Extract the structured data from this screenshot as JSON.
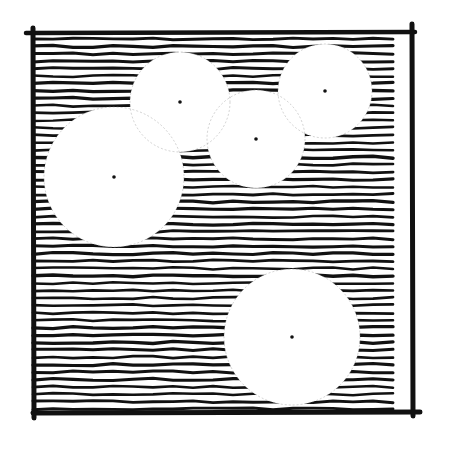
{
  "illustration": {
    "description": "Hand-drawn square with horizontal hatching and five white circles, each marked with a center dot",
    "colors": {
      "ink": "#111111",
      "paper": "#ffffff",
      "overlap_line": "#9a9a9a"
    },
    "frame": {
      "x": 33,
      "y": 33,
      "width": 379,
      "height": 380
    },
    "hatch_spacing": 7.4,
    "circles": [
      {
        "id": "circle-top-middle",
        "cx": 180,
        "cy": 102,
        "r": 50
      },
      {
        "id": "circle-top-right",
        "cx": 325,
        "cy": 91,
        "r": 47
      },
      {
        "id": "circle-center",
        "cx": 256,
        "cy": 139,
        "r": 49
      },
      {
        "id": "circle-left-large",
        "cx": 114,
        "cy": 177,
        "r": 70
      },
      {
        "id": "circle-bottom",
        "cx": 292,
        "cy": 337,
        "r": 68
      }
    ]
  }
}
